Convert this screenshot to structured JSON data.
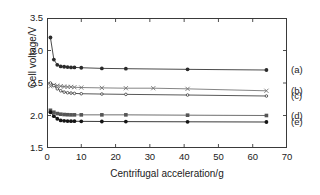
{
  "chart_data": {
    "type": "line",
    "title": "",
    "xlabel": "Centrifugal acceleration/g",
    "ylabel": "Cell voltage/V",
    "xlim": [
      0,
      70
    ],
    "ylim": [
      1.5,
      3.5
    ],
    "xticks": [
      0,
      10,
      20,
      30,
      40,
      50,
      60,
      70
    ],
    "yticks": [
      1.5,
      2.0,
      2.5,
      3.0,
      3.5
    ],
    "xtick_labels": [
      "0",
      "10",
      "20",
      "30",
      "40",
      "50",
      "60",
      "70"
    ],
    "ytick_labels": [
      "1.5",
      "2.0",
      "2.5",
      "3.0",
      "3.5"
    ],
    "grid": false,
    "legend_position": "right-inline-end-of-line",
    "series": [
      {
        "name": "(a)",
        "marker": "filled-circle",
        "color": "#2b2b2b",
        "x": [
          1,
          2,
          3,
          4,
          5,
          6,
          7,
          8,
          10,
          16,
          23,
          41,
          64
        ],
        "y": [
          3.2,
          2.86,
          2.78,
          2.755,
          2.75,
          2.745,
          2.74,
          2.74,
          2.735,
          2.725,
          2.72,
          2.71,
          2.7
        ]
      },
      {
        "name": "(b)",
        "marker": "cross-x",
        "color": "#6f6f6f",
        "x": [
          1,
          2,
          3,
          4,
          5,
          6,
          7,
          8,
          10,
          16,
          23,
          31,
          41,
          64
        ],
        "y": [
          2.45,
          2.47,
          2.46,
          2.45,
          2.445,
          2.44,
          2.44,
          2.435,
          2.43,
          2.425,
          2.42,
          2.42,
          2.41,
          2.38
        ]
      },
      {
        "name": "(c)",
        "marker": "small-open-circle",
        "color": "#3a3a3a",
        "x": [
          1,
          2,
          3,
          4,
          5,
          6,
          7,
          8,
          10,
          16,
          23,
          41,
          64
        ],
        "y": [
          2.5,
          2.46,
          2.41,
          2.38,
          2.36,
          2.35,
          2.345,
          2.34,
          2.335,
          2.33,
          2.325,
          2.315,
          2.3
        ]
      },
      {
        "name": "(d)",
        "marker": "filled-square",
        "color": "#555555",
        "x": [
          1,
          2,
          3,
          4,
          5,
          6,
          7,
          8,
          10,
          16,
          23,
          41,
          64
        ],
        "y": [
          2.08,
          2.05,
          2.03,
          2.02,
          2.015,
          2.012,
          2.01,
          2.01,
          2.01,
          2.01,
          2.01,
          2.005,
          2.0
        ]
      },
      {
        "name": "(e)",
        "marker": "filled-circle",
        "color": "#151515",
        "x": [
          1,
          2,
          3,
          4,
          5,
          6,
          7,
          8,
          10,
          16,
          23,
          41,
          64
        ],
        "y": [
          2.05,
          1.99,
          1.95,
          1.925,
          1.918,
          1.915,
          1.913,
          1.912,
          1.91,
          1.908,
          1.906,
          1.903,
          1.9
        ]
      }
    ]
  }
}
